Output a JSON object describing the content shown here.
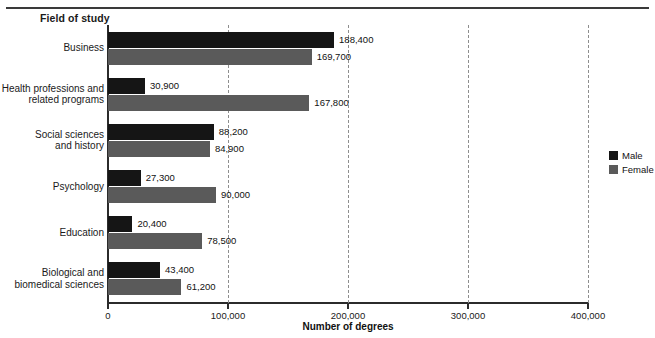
{
  "header": {
    "axis_group_title": "Field of study"
  },
  "legend": {
    "position": "right",
    "items": [
      {
        "label": "Male",
        "color": "#151515",
        "swatch_name": "legend-swatch-male"
      },
      {
        "label": "Female",
        "color": "#5a5a5a",
        "swatch_name": "legend-swatch-female"
      }
    ]
  },
  "axis": {
    "x_title": "Number of degrees",
    "x_ticks": [
      "0",
      "100,000",
      "200,000",
      "300,000",
      "400,000"
    ],
    "x_tick_values": [
      0,
      100000,
      200000,
      300000,
      400000
    ]
  },
  "chart_data": {
    "type": "bar",
    "orientation": "horizontal",
    "title": "",
    "subtitle": "",
    "xlabel": "Number of degrees",
    "ylabel": "Field of study",
    "xlim": [
      0,
      400000
    ],
    "grid": true,
    "grid_axis": "x",
    "legend_position": "right",
    "categories": [
      "Business",
      "Health professions and\nrelated programs",
      "Social sciences\nand history",
      "Psychology",
      "Education",
      "Biological and\nbiomedical sciences"
    ],
    "series": [
      {
        "name": "Male",
        "color": "#151515",
        "values": [
          188400,
          30900,
          88200,
          27300,
          20400,
          43400
        ],
        "labels": [
          "188,400",
          "30,900",
          "88,200",
          "27,300",
          "20,400",
          "43,400"
        ]
      },
      {
        "name": "Female",
        "color": "#5a5a5a",
        "values": [
          169700,
          167800,
          84900,
          90000,
          78500,
          61200
        ],
        "labels": [
          "169,700",
          "167,800",
          "84,900",
          "90,000",
          "78,500",
          "61,200"
        ]
      }
    ],
    "tick_labels": [
      "0",
      "100,000",
      "200,000",
      "300,000",
      "400,000"
    ],
    "ticks": [
      0,
      100000,
      200000,
      300000,
      400000
    ]
  }
}
